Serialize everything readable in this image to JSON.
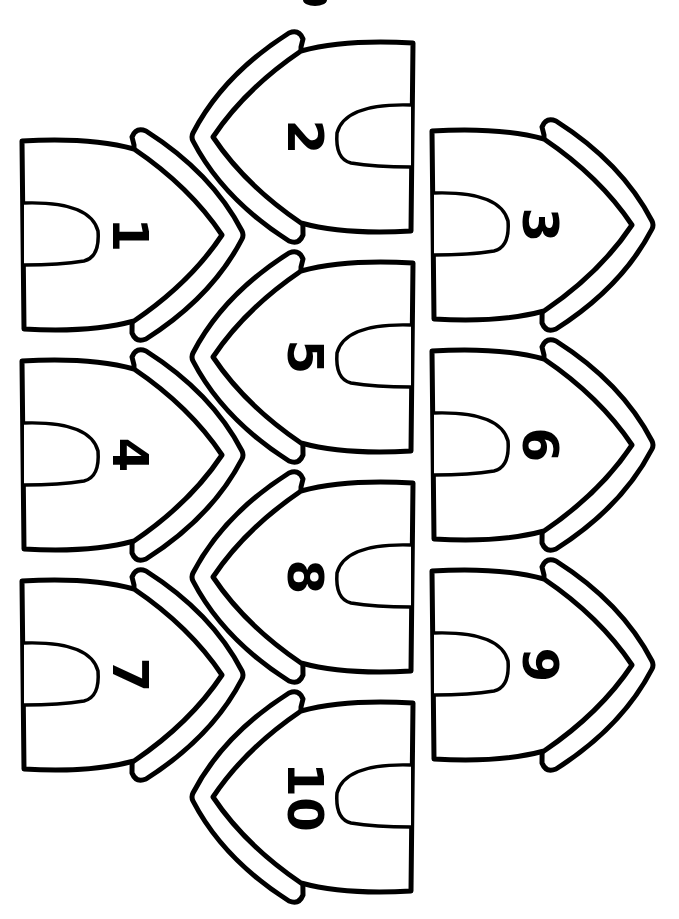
{
  "page": {
    "background": "#ffffff",
    "line_color": "#000000"
  },
  "worksheet": {
    "houses": [
      {
        "label": "1",
        "column": "left",
        "cx": 130,
        "cy": 235,
        "facing": "right"
      },
      {
        "label": "2",
        "column": "middle",
        "cx": 305,
        "cy": 137,
        "facing": "left"
      },
      {
        "label": "3",
        "column": "right",
        "cx": 540,
        "cy": 225,
        "facing": "right"
      },
      {
        "label": "4",
        "column": "left",
        "cx": 130,
        "cy": 455,
        "facing": "right"
      },
      {
        "label": "5",
        "column": "middle",
        "cx": 305,
        "cy": 357,
        "facing": "left"
      },
      {
        "label": "6",
        "column": "right",
        "cx": 540,
        "cy": 445,
        "facing": "right"
      },
      {
        "label": "7",
        "column": "left",
        "cx": 130,
        "cy": 675,
        "facing": "right"
      },
      {
        "label": "8",
        "column": "middle",
        "cx": 305,
        "cy": 577,
        "facing": "left"
      },
      {
        "label": "9",
        "column": "right",
        "cx": 540,
        "cy": 665,
        "facing": "right"
      },
      {
        "label": "10",
        "column": "middle",
        "cx": 305,
        "cy": 797,
        "facing": "left"
      }
    ]
  }
}
